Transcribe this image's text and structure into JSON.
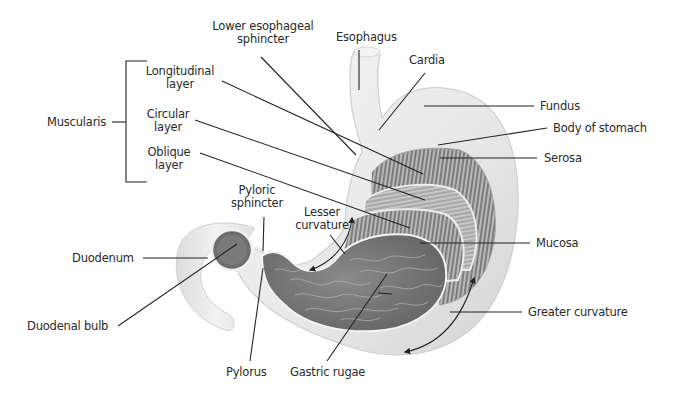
{
  "diagram": {
    "labels": {
      "lower_esophageal_sphincter": [
        "Lower esophageal",
        "sphincter"
      ],
      "esophagus": "Esophagus",
      "cardia": "Cardia",
      "fundus": "Fundus",
      "body_of_stomach": "Body of stomach",
      "serosa": "Serosa",
      "muscularis": "Muscularis",
      "longitudinal_layer": [
        "Longitudinal",
        "layer"
      ],
      "circular_layer": [
        "Circular",
        "layer"
      ],
      "oblique_layer": [
        "Oblique",
        "layer"
      ],
      "pyloric_sphincter": [
        "Pyloric",
        "sphincter"
      ],
      "lesser_curvature": [
        "Lesser",
        "curvature"
      ],
      "duodenum": "Duodenum",
      "mucosa": "Mucosa",
      "duodenal_bulb": "Duodenal bulb",
      "greater_curvature": "Greater curvature",
      "pylorus": "Pylorus",
      "gastric_rugae": "Gastric rugae"
    },
    "colors": {
      "outer_wall": "#ececec",
      "outer_wall_shade": "#d8d8d8",
      "muscle_stripes": "#8a8a8a",
      "mucosa": "#7d7d7d",
      "mucosa_dark": "#5e5e5e",
      "leader_line": "#222222",
      "text": "#2a2a2a"
    }
  }
}
